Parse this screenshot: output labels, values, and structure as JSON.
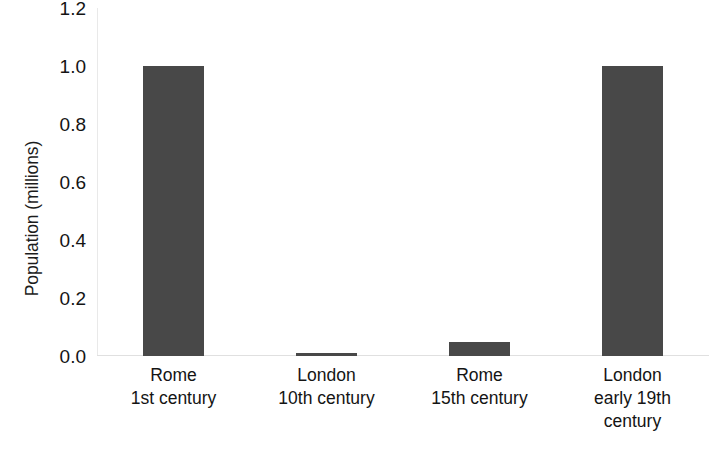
{
  "chart_data": {
    "type": "bar",
    "title": "",
    "xlabel": "",
    "ylabel": "Population (millions)",
    "categories": [
      "Rome 1st century",
      "London 10th century",
      "Rome 15th century",
      "London early 19th century"
    ],
    "category_lines": [
      [
        "Rome",
        "1st century"
      ],
      [
        "London",
        "10th century"
      ],
      [
        "Rome",
        "15th century"
      ],
      [
        "London",
        "early 19th",
        "century"
      ]
    ],
    "values": [
      1.0,
      0.01,
      0.05,
      1.0
    ],
    "ylim": [
      0.0,
      1.2
    ],
    "ytick_values": [
      0.0,
      0.2,
      0.4,
      0.6,
      0.8,
      1.0,
      1.2
    ],
    "ytick_labels": [
      "0.0",
      "0.2",
      "0.4",
      "0.6",
      "0.8",
      "1.0",
      "1.2"
    ],
    "grid": false,
    "legend": false,
    "legend_position": "none",
    "bar_color": "#484848",
    "background_color": "#ffffff",
    "axis_color": "#e0e0e0",
    "text_color": "#141414"
  }
}
